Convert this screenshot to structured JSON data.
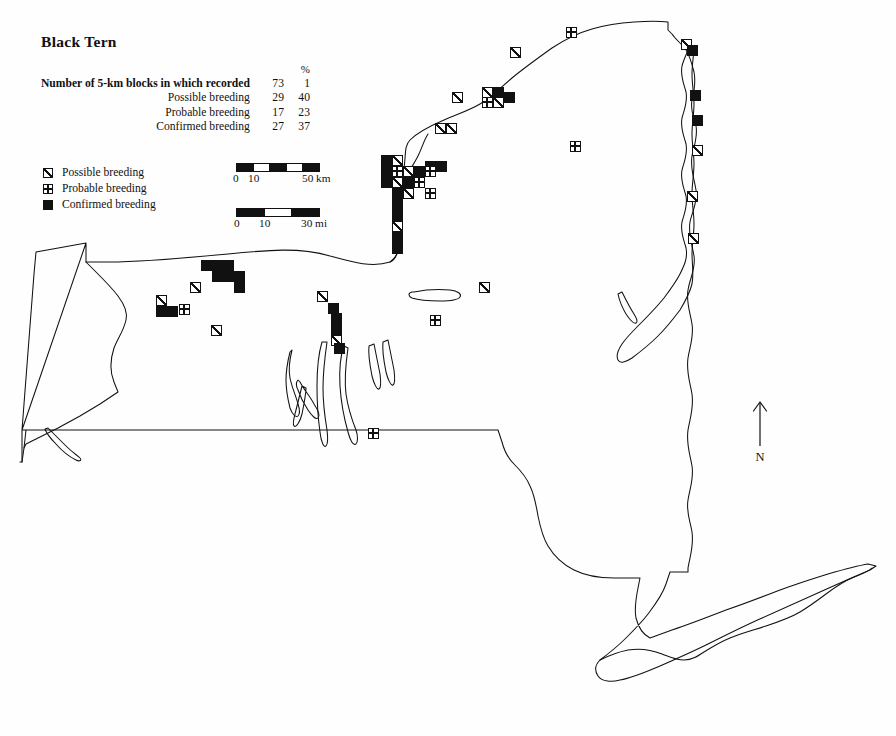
{
  "header": {
    "title": "Black Tern",
    "percent_header": "%",
    "rows": [
      {
        "label": "Number of 5-km blocks in which recorded",
        "count": "73",
        "pct": "1",
        "bold": true
      },
      {
        "label": "Possible breeding",
        "count": "29",
        "pct": "40",
        "bold": false
      },
      {
        "label": "Probable breeding",
        "count": "17",
        "pct": "23",
        "bold": false
      },
      {
        "label": "Confirmed breeding",
        "count": "27",
        "pct": "37",
        "bold": false
      }
    ]
  },
  "legend": {
    "items": [
      {
        "symbol": "possible-breeding-icon",
        "label": "Possible breeding"
      },
      {
        "symbol": "probable-breeding-icon",
        "label": "Probable breeding"
      },
      {
        "symbol": "confirmed-breeding-icon",
        "label": "Confirmed breeding"
      }
    ]
  },
  "scale": {
    "km": {
      "left_labels": [
        "0",
        "10"
      ],
      "right_label": "50 km",
      "segments": [
        "fill",
        "empty",
        "fill",
        "empty",
        "fill"
      ]
    },
    "mi": {
      "left_labels": [
        "0",
        "10"
      ],
      "right_label": "30 mi",
      "segments": [
        "fill",
        "empty",
        "fill"
      ]
    }
  },
  "compass": {
    "icon": "north-arrow-icon",
    "label": "N"
  },
  "map": {
    "region": "New York State",
    "symbol_size": 11,
    "markers": [
      {
        "t": "probable",
        "x": 571,
        "y": 32
      },
      {
        "t": "possible",
        "x": 515,
        "y": 52
      },
      {
        "t": "possible",
        "x": 686,
        "y": 44
      },
      {
        "t": "confirmed",
        "x": 692,
        "y": 50
      },
      {
        "t": "possible",
        "x": 457,
        "y": 97
      },
      {
        "t": "possible",
        "x": 487,
        "y": 92
      },
      {
        "t": "confirmed",
        "x": 498,
        "y": 92
      },
      {
        "t": "probable",
        "x": 487,
        "y": 102
      },
      {
        "t": "possible",
        "x": 498,
        "y": 102
      },
      {
        "t": "confirmed",
        "x": 509,
        "y": 97
      },
      {
        "t": "possible",
        "x": 440,
        "y": 128
      },
      {
        "t": "possible",
        "x": 451,
        "y": 128
      },
      {
        "t": "probable",
        "x": 575,
        "y": 146
      },
      {
        "t": "confirmed",
        "x": 695,
        "y": 95
      },
      {
        "t": "confirmed",
        "x": 697,
        "y": 120
      },
      {
        "t": "possible",
        "x": 697,
        "y": 150
      },
      {
        "t": "possible",
        "x": 692,
        "y": 196
      },
      {
        "t": "possible",
        "x": 693,
        "y": 238
      },
      {
        "t": "confirmed",
        "x": 386,
        "y": 160
      },
      {
        "t": "possible",
        "x": 397,
        "y": 160
      },
      {
        "t": "confirmed",
        "x": 430,
        "y": 166
      },
      {
        "t": "confirmed",
        "x": 441,
        "y": 166
      },
      {
        "t": "confirmed",
        "x": 386,
        "y": 171
      },
      {
        "t": "probable",
        "x": 397,
        "y": 171
      },
      {
        "t": "possible",
        "x": 408,
        "y": 171
      },
      {
        "t": "confirmed",
        "x": 419,
        "y": 171
      },
      {
        "t": "probable",
        "x": 430,
        "y": 171
      },
      {
        "t": "confirmed",
        "x": 386,
        "y": 182
      },
      {
        "t": "possible",
        "x": 397,
        "y": 182
      },
      {
        "t": "confirmed",
        "x": 408,
        "y": 182
      },
      {
        "t": "probable",
        "x": 419,
        "y": 182
      },
      {
        "t": "probable",
        "x": 430,
        "y": 193
      },
      {
        "t": "confirmed",
        "x": 397,
        "y": 193
      },
      {
        "t": "possible",
        "x": 408,
        "y": 193
      },
      {
        "t": "confirmed",
        "x": 397,
        "y": 204
      },
      {
        "t": "confirmed",
        "x": 397,
        "y": 215
      },
      {
        "t": "possible",
        "x": 397,
        "y": 226
      },
      {
        "t": "confirmed",
        "x": 397,
        "y": 237
      },
      {
        "t": "confirmed",
        "x": 397,
        "y": 248
      },
      {
        "t": "confirmed",
        "x": 206,
        "y": 265
      },
      {
        "t": "confirmed",
        "x": 217,
        "y": 265
      },
      {
        "t": "confirmed",
        "x": 228,
        "y": 265
      },
      {
        "t": "confirmed",
        "x": 217,
        "y": 276
      },
      {
        "t": "confirmed",
        "x": 228,
        "y": 276
      },
      {
        "t": "confirmed",
        "x": 239,
        "y": 276
      },
      {
        "t": "confirmed",
        "x": 239,
        "y": 287
      },
      {
        "t": "possible",
        "x": 195,
        "y": 287
      },
      {
        "t": "possible",
        "x": 161,
        "y": 300
      },
      {
        "t": "confirmed",
        "x": 161,
        "y": 311
      },
      {
        "t": "confirmed",
        "x": 172,
        "y": 311
      },
      {
        "t": "probable",
        "x": 184,
        "y": 309
      },
      {
        "t": "possible",
        "x": 216,
        "y": 330
      },
      {
        "t": "possible",
        "x": 322,
        "y": 296
      },
      {
        "t": "confirmed",
        "x": 333,
        "y": 308
      },
      {
        "t": "possible",
        "x": 484,
        "y": 287
      },
      {
        "t": "probable",
        "x": 435,
        "y": 320
      },
      {
        "t": "confirmed",
        "x": 336,
        "y": 318
      },
      {
        "t": "confirmed",
        "x": 336,
        "y": 329
      },
      {
        "t": "possible",
        "x": 336,
        "y": 340
      },
      {
        "t": "confirmed",
        "x": 339,
        "y": 348
      },
      {
        "t": "probable",
        "x": 373,
        "y": 433
      }
    ]
  }
}
